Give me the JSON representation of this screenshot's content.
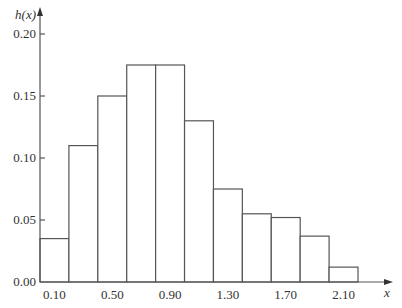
{
  "chart_data": {
    "type": "bar",
    "title": "",
    "xlabel": "x",
    "ylabel": "h(x)",
    "bin_width": 0.2,
    "bin_midpoints": [
      0.1,
      0.3,
      0.5,
      0.7,
      0.9,
      1.1,
      1.3,
      1.5,
      1.7,
      1.9,
      2.1
    ],
    "values": [
      0.035,
      0.11,
      0.15,
      0.175,
      0.175,
      0.13,
      0.075,
      0.055,
      0.052,
      0.037,
      0.012
    ],
    "ylim": [
      0,
      0.2
    ],
    "xlim": [
      0.0,
      2.2
    ],
    "yticks": [
      "0.00",
      "0.05",
      "0.10",
      "0.15",
      "0.20"
    ],
    "ytick_values": [
      0.0,
      0.05,
      0.1,
      0.15,
      0.2
    ],
    "xticks": [
      "0.10",
      "0.50",
      "0.90",
      "1.30",
      "1.70",
      "2.10"
    ],
    "xtick_values": [
      0.1,
      0.5,
      0.9,
      1.3,
      1.7,
      2.1
    ],
    "grid": false,
    "legend": null
  }
}
